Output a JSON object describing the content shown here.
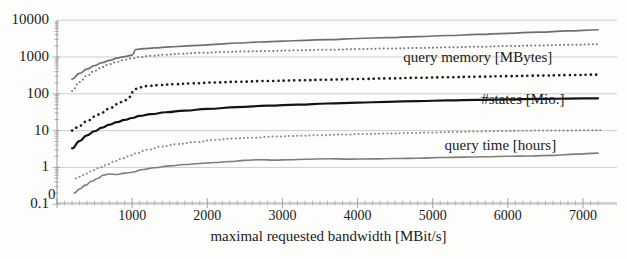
{
  "chart_data": {
    "type": "line",
    "title": "",
    "xlabel": "maximal requested bandwidth [MBit/s]",
    "ylabel": "",
    "xlim": [
      0,
      7300
    ],
    "ylim": [
      0.1,
      10000
    ],
    "yscale": "log",
    "xscale": "linear",
    "grid": true,
    "legend_position": "inline-right",
    "xticks": [
      0,
      1000,
      2000,
      3000,
      4000,
      5000,
      6000,
      7000
    ],
    "xtick_labels": [
      "0",
      "1000",
      "2000",
      "3000",
      "4000",
      "5000",
      "6000",
      "7000"
    ],
    "yticks": [
      0.1,
      1,
      10,
      100,
      1000,
      10000
    ],
    "ytick_labels": [
      "0.1",
      "1",
      "10",
      "100",
      "1000",
      "10000"
    ],
    "annotations": [
      {
        "id": "anno-query-memory",
        "text": "query memory [MBytes]",
        "x": 5600,
        "y": 900
      },
      {
        "id": "anno-states",
        "text": "#states [Mio.]",
        "x": 6200,
        "y": 62
      },
      {
        "id": "anno-query-time",
        "text": "query time [hours]",
        "x": 5900,
        "y": 3.6
      }
    ],
    "series": [
      {
        "name": "query memory [MBytes] upper",
        "style": "solid",
        "color": "#6f6f6f",
        "width": 1.7,
        "x": [
          200,
          300,
          400,
          500,
          600,
          700,
          800,
          900,
          1000,
          1050,
          1150,
          1300,
          1500,
          1700,
          1900,
          2100,
          2400,
          2700,
          3000,
          3300,
          3600,
          4000,
          4400,
          4800,
          5200,
          5600,
          6000,
          6400,
          6800,
          7200
        ],
        "y": [
          250,
          360,
          470,
          580,
          700,
          810,
          930,
          1030,
          1120,
          1600,
          1680,
          1760,
          1880,
          1980,
          2080,
          2200,
          2400,
          2560,
          2700,
          2840,
          2980,
          3180,
          3380,
          3600,
          3840,
          4100,
          4400,
          4750,
          5100,
          5500
        ]
      },
      {
        "name": "query memory [MBytes] lower",
        "style": "dotted",
        "color": "#7a7a7a",
        "width": 2.0,
        "x": [
          200,
          300,
          400,
          500,
          600,
          700,
          800,
          900,
          1000,
          1100,
          1250,
          1450,
          1650,
          1900,
          2200,
          2500,
          2800,
          3200,
          3600,
          4000,
          4400,
          4800,
          5200,
          5600,
          6000,
          6400,
          6800,
          7200
        ],
        "y": [
          120,
          210,
          310,
          420,
          530,
          640,
          740,
          840,
          920,
          1000,
          1080,
          1160,
          1230,
          1300,
          1360,
          1420,
          1460,
          1520,
          1580,
          1640,
          1700,
          1760,
          1830,
          1900,
          1980,
          2060,
          2140,
          2220
        ]
      },
      {
        "name": "#states [Mio.]",
        "style": "dotted",
        "color": "#1c1c1c",
        "width": 2.6,
        "x": [
          200,
          300,
          400,
          500,
          600,
          700,
          800,
          900,
          960,
          1000,
          1040,
          1100,
          1200,
          1350,
          1550,
          1800,
          2100,
          2400,
          2800,
          3200,
          3600,
          4000,
          4400,
          4800,
          5200,
          5600,
          6000,
          6400,
          6800,
          7200
        ],
        "y": [
          10,
          13.5,
          18,
          24,
          31,
          40,
          52,
          66,
          80,
          110,
          135,
          150,
          162,
          172,
          182,
          192,
          203,
          212,
          223,
          232,
          242,
          252,
          262,
          272,
          282,
          292,
          302,
          312,
          322,
          332
        ]
      },
      {
        "name": "query time solid dark",
        "style": "solid",
        "color": "#141414",
        "width": 2.2,
        "x": [
          200,
          300,
          400,
          500,
          600,
          700,
          800,
          900,
          1000,
          1100,
          1250,
          1450,
          1700,
          2000,
          2400,
          2800,
          3200,
          3600,
          4000,
          4400,
          4800,
          5200,
          5600,
          6000,
          6400,
          6800,
          7200
        ],
        "y": [
          3.3,
          5.2,
          7.4,
          9.6,
          12,
          14.5,
          17,
          19.5,
          22,
          25,
          28,
          31.5,
          35,
          39,
          43.5,
          47.5,
          51,
          54.5,
          57.5,
          60.5,
          63.5,
          66,
          68.5,
          70.5,
          72.5,
          74,
          75.5
        ]
      },
      {
        "name": "query time dotted gray",
        "style": "dotted",
        "color": "#8a8a8a",
        "width": 2.0,
        "x": [
          250,
          350,
          450,
          550,
          650,
          750,
          850,
          950,
          1050,
          1200,
          1400,
          1600,
          1850,
          2100,
          2350,
          2600,
          2900,
          3200,
          3500,
          3800,
          4100,
          4400,
          4700,
          5000,
          5300,
          5600,
          5900,
          6200,
          6500,
          6800,
          7100,
          7250
        ],
        "y": [
          0.5,
          0.62,
          0.78,
          0.95,
          1.15,
          1.4,
          1.7,
          2.0,
          2.4,
          3.0,
          3.7,
          4.3,
          4.9,
          5.6,
          6.1,
          6.4,
          6.9,
          7.2,
          7.5,
          7.8,
          8.1,
          8.3,
          8.6,
          8.9,
          9.2,
          9.5,
          9.7,
          9.9,
          10.1,
          10.0,
          10.3,
          10.2
        ]
      },
      {
        "name": "query time [hours]",
        "style": "solid",
        "color": "#7e7e7e",
        "width": 1.6,
        "x": [
          230,
          300,
          380,
          460,
          540,
          620,
          700,
          800,
          900,
          1000,
          1150,
          1300,
          1500,
          1700,
          1900,
          2100,
          2300,
          2500,
          2700,
          2900,
          3100,
          3300,
          3600,
          3900,
          4200,
          4500,
          4800,
          5100,
          5400,
          5700,
          6000,
          6300,
          6600,
          6900,
          7200
        ],
        "y": [
          0.2,
          0.26,
          0.33,
          0.42,
          0.5,
          0.62,
          0.66,
          0.64,
          0.7,
          0.74,
          0.88,
          0.98,
          1.1,
          1.2,
          1.28,
          1.36,
          1.45,
          1.55,
          1.62,
          1.58,
          1.62,
          1.66,
          1.72,
          1.68,
          1.7,
          1.74,
          1.78,
          1.85,
          1.9,
          1.94,
          2.0,
          2.05,
          2.12,
          2.3,
          2.45
        ]
      }
    ]
  },
  "axes": {
    "origin_label": "0"
  }
}
